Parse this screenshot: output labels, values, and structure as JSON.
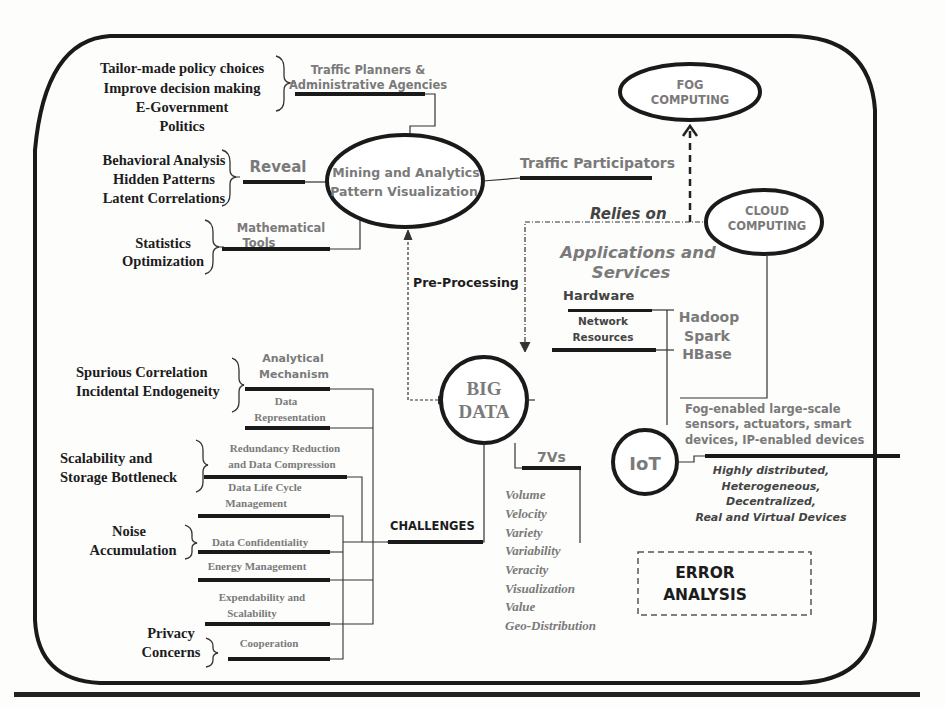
{
  "policy": {
    "items": [
      "Tailor-made policy choices",
      "Improve decision making",
      "E-Government",
      "Politics"
    ],
    "link_label": [
      "Traffic Planners &",
      "Administrative Agencies"
    ]
  },
  "reveal": {
    "items": [
      "Behavioral Analysis",
      "Hidden Patterns",
      "Latent Correlations"
    ],
    "link_label": "Reveal"
  },
  "math": {
    "items": [
      "Statistics",
      "Optimization"
    ],
    "link_label": [
      "Mathematical",
      "Tools"
    ]
  },
  "nodes": {
    "mining": [
      "Mining and Analytics",
      "Pattern Visualization"
    ],
    "fog": [
      "FOG",
      "COMPUTING"
    ],
    "cloud": [
      "CLOUD",
      "COMPUTING"
    ],
    "big_data": [
      "BIG",
      "DATA"
    ],
    "iot": "IoT",
    "error": [
      "ERROR",
      "ANALYSIS"
    ]
  },
  "traffic_participators": "Traffic Participators",
  "relies_on": "Relies on",
  "pre_processing": "Pre-Processing",
  "apps": {
    "title": [
      "Applications and",
      "Services"
    ],
    "hardware": "Hardware",
    "network": [
      "Network",
      "Resources"
    ],
    "tools": [
      "Hadoop",
      "Spark",
      "HBase"
    ]
  },
  "iot_info": {
    "devices": [
      "Fog-enabled large-scale",
      "sensors, actuators, smart",
      "devices, IP-enabled devices"
    ],
    "traits": [
      "Highly distributed,",
      "Heterogeneous,",
      "Decentralized,",
      "Real and Virtual Devices"
    ]
  },
  "seven_vs": {
    "label": "7Vs",
    "items": [
      "Volume",
      "Velocity",
      "Variety",
      "Variability",
      "Veracity",
      "Visualization",
      "Value",
      "Geo-Distribution"
    ]
  },
  "challenges": {
    "label": "CHALLENGES",
    "groups": [
      {
        "title": [
          "Spurious Correlation",
          "Incidental Endogeneity"
        ]
      },
      {
        "title": [
          "Scalability and",
          "Storage Bottleneck"
        ]
      },
      {
        "title": [
          "Noise",
          "Accumulation"
        ]
      },
      {
        "title": [
          "Privacy",
          "Concerns"
        ]
      }
    ],
    "items": [
      [
        "Analytical",
        "Mechanism"
      ],
      [
        "Data",
        "Representation"
      ],
      [
        "Redundancy Reduction",
        "and Data Compression"
      ],
      [
        "Data Life Cycle",
        "Management"
      ],
      [
        "Data Confidentiality"
      ],
      [
        "Energy Management"
      ],
      [
        "Expendability and",
        "Scalability"
      ],
      [
        "Cooperation"
      ]
    ]
  }
}
